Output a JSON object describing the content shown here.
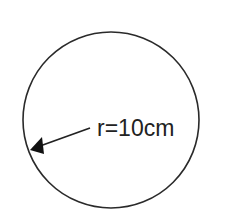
{
  "diagram": {
    "shape": "circle",
    "radius_label": "r=10cm",
    "stroke_color": "#2a2a2a",
    "background": "#ffffff"
  }
}
